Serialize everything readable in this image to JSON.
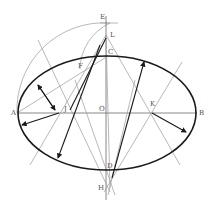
{
  "diagram": {
    "title": "",
    "labels": {
      "A": "A",
      "B": "B",
      "C": "C",
      "D": "D",
      "E": "E",
      "F": "F",
      "H": "H",
      "J": "J",
      "K": "K",
      "L": "L",
      "O": "O"
    },
    "colors": {
      "ellipse": "#1a1a1a",
      "construction": "#9a9a9a",
      "axis": "#6a6a6a",
      "label": "#555555"
    }
  }
}
